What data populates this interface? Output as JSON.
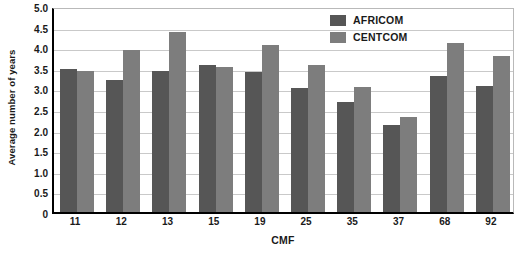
{
  "chart_data": {
    "type": "bar",
    "title": "",
    "xlabel": "CMF",
    "ylabel": "Average number of years",
    "categories": [
      "11",
      "12",
      "13",
      "15",
      "19",
      "25",
      "35",
      "37",
      "68",
      "92"
    ],
    "series": [
      {
        "name": "AFRICOM",
        "color": "#565656",
        "values": [
          3.47,
          3.2,
          3.42,
          3.56,
          3.41,
          3.0,
          2.67,
          2.11,
          3.3,
          3.06
        ]
      },
      {
        "name": "CENTCOM",
        "color": "#7d7d7d",
        "values": [
          3.43,
          3.93,
          4.36,
          3.53,
          4.06,
          3.56,
          3.04,
          2.31,
          4.11,
          3.79
        ]
      }
    ],
    "ylim": [
      0,
      5.0
    ],
    "ytick_step": 0.5,
    "yticks": [
      "5.0",
      "4.5",
      "4.0",
      "3.5",
      "3.0",
      "2.5",
      "2.0",
      "1.5",
      "1.0",
      "0.5",
      "0"
    ],
    "grid": true,
    "legend_position": "top-right"
  }
}
